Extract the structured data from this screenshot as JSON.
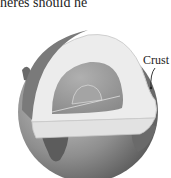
{
  "caption": {
    "text": "heres should he"
  },
  "figure": {
    "labels": [
      {
        "text": "Crust"
      }
    ],
    "colors": {
      "surface": "#8a8a8a",
      "mantle": "#ececec",
      "outer_core": "#9a9a9a",
      "inner_core": "#a8a8a8",
      "crust_rim": "#d8d8d8"
    }
  }
}
